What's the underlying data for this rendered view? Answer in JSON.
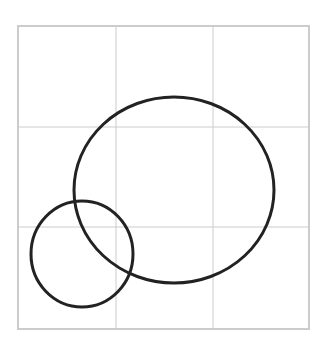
{
  "diagram": {
    "canvas": {
      "width": 328,
      "height": 347,
      "background": "#ffffff"
    },
    "grid": {
      "x0": 18,
      "y0": 26,
      "x1": 309,
      "y1": 329,
      "vertical_lines": [
        116,
        213
      ],
      "horizontal_lines": [
        127,
        227
      ],
      "border_color": "#cccccc",
      "line_color": "#cccccc",
      "rows": 3,
      "cols": 3
    },
    "shapes": [
      {
        "type": "ellipse",
        "name": "large-ellipse",
        "cx": 174,
        "cy": 190,
        "rx": 100,
        "ry": 93,
        "stroke": "#222222",
        "stroke_width": 3
      },
      {
        "type": "ellipse",
        "name": "small-circle",
        "cx": 82,
        "cy": 254,
        "rx": 51,
        "ry": 53,
        "stroke": "#222222",
        "stroke_width": 3
      }
    ]
  }
}
